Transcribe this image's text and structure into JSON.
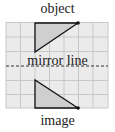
{
  "labels": {
    "top": "object",
    "middle": "mirror line",
    "bottom": "image"
  },
  "grid": {
    "columns": 7,
    "rows_above": 3,
    "rows_below": 3
  },
  "colors": {
    "grid_fill": "#ebebeb",
    "grid_line": "#c8c8c8",
    "triangle_fill": "#cfcfcf",
    "stroke": "#111111"
  }
}
